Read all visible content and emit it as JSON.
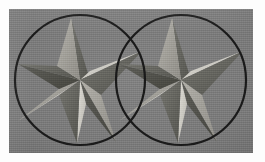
{
  "image": {
    "title": "Two overlapping circles each containing a faceted five-pointed star",
    "width": 265,
    "height": 162,
    "background_color": "#fdfdfd",
    "panel": {
      "x": 9,
      "y": 9,
      "width": 244,
      "height": 144,
      "fill_color": "#7a7a7a"
    }
  },
  "palette": {
    "background_gray": "#7a7a7a",
    "outline_black": "#1a1a1a",
    "facet_highlight": "#d6d4cd",
    "facet_light": "#bcbab3",
    "facet_mid": "#9a9892",
    "facet_shadow": "#6a6a66",
    "facet_dark": "#595957",
    "facet_darkest": "#4c4c4a"
  },
  "circles": [
    {
      "name": "left-circle",
      "cx": 71,
      "cy": 71,
      "r": 65,
      "stroke": "#1a1a1a",
      "stroke_width": 2.2
    },
    {
      "name": "right-circle",
      "cx": 172,
      "cy": 71,
      "r": 65,
      "stroke": "#1a1a1a",
      "stroke_width": 2.2
    }
  ],
  "stars": [
    {
      "name": "left-star",
      "cx": 71,
      "cy": 71,
      "outer_radius": 62,
      "inner_radius": 24,
      "points": 5,
      "rotation_deg": 0,
      "facet_colors": {
        "left_half": "#c9c7c0",
        "right_half": "#6e6e6a"
      }
    },
    {
      "name": "right-star",
      "cx": 172,
      "cy": 71,
      "outer_radius": 62,
      "inner_radius": 24,
      "points": 5,
      "rotation_deg": 0,
      "facet_colors": {
        "left_half": "#c9c7c0",
        "right_half": "#6e6e6a"
      }
    }
  ],
  "overlap": {
    "description": "Circles intersect near horizontal center",
    "intersection_x_range": [
      128,
      132
    ]
  }
}
